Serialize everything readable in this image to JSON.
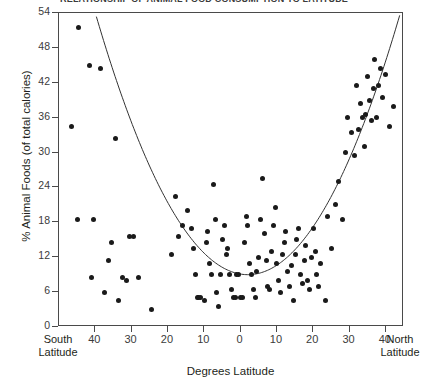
{
  "figure": {
    "title_clipped": "RELATIONSHIP OF ANIMAL FOOD CONSUMPTION TO LATITUDE",
    "width": 428,
    "height": 383
  },
  "axes": {
    "ylabel": "% Animal Foods (of total calories)",
    "xlabel": "Degrees Latitude",
    "left_edge_label_line1": "South",
    "left_edge_label_line2": "Latitude",
    "right_edge_label_line1": "North",
    "right_edge_label_line2": "Latitude",
    "yticks": [
      0,
      6,
      12,
      18,
      24,
      30,
      36,
      42,
      48,
      54
    ],
    "xticks": [
      40,
      30,
      20,
      10,
      0,
      10,
      20,
      30,
      40
    ]
  },
  "colors": {
    "marker": "#1a1a1a",
    "axis": "#4a4a4a",
    "curve": "#333333",
    "background": "#ffffff"
  },
  "chart_data": {
    "type": "scatter",
    "title": "RELATIONSHIP OF ANIMAL FOOD CONSUMPTION TO LATITUDE",
    "xlabel": "Degrees Latitude",
    "ylabel": "% Animal Foods (of total calories)",
    "xlim": [
      -50,
      45
    ],
    "ylim": [
      0,
      54
    ],
    "x_axis_note": "Negative values are South Latitude, positive values are North Latitude; tick labels show absolute degrees.",
    "grid": false,
    "legend": null,
    "ytick_values": [
      0,
      6,
      12,
      18,
      24,
      30,
      36,
      42,
      48,
      54
    ],
    "xtick_labels": [
      "South Latitude",
      "40",
      "30",
      "20",
      "10",
      "0",
      "10",
      "20",
      "30",
      "40",
      "North Latitude"
    ],
    "points": [
      [
        -44.5,
        51.5
      ],
      [
        -41.5,
        45.0
      ],
      [
        -38.5,
        44.5
      ],
      [
        -46.5,
        34.5
      ],
      [
        -34.5,
        32.5
      ],
      [
        -45.0,
        18.5
      ],
      [
        -40.5,
        18.5
      ],
      [
        -35.5,
        14.5
      ],
      [
        -41.0,
        8.5
      ],
      [
        -37.5,
        6.0
      ],
      [
        -36.5,
        11.5
      ],
      [
        -32.5,
        8.5
      ],
      [
        -31.5,
        8.0
      ],
      [
        -28.0,
        8.5
      ],
      [
        -33.5,
        4.5
      ],
      [
        -30.5,
        15.5
      ],
      [
        -29.5,
        15.5
      ],
      [
        -24.5,
        3.0
      ],
      [
        -19.0,
        12.5
      ],
      [
        -18.0,
        22.5
      ],
      [
        -17.0,
        15.5
      ],
      [
        -16.0,
        17.5
      ],
      [
        -14.5,
        20.0
      ],
      [
        -13.5,
        17.0
      ],
      [
        -13.0,
        13.5
      ],
      [
        -12.5,
        9.0
      ],
      [
        -12.0,
        5.0
      ],
      [
        -11.5,
        5.0
      ],
      [
        -11.0,
        5.0
      ],
      [
        -10.0,
        4.5
      ],
      [
        -9.5,
        14.5
      ],
      [
        -9.0,
        16.5
      ],
      [
        -8.5,
        11.0
      ],
      [
        -8.0,
        9.0
      ],
      [
        -7.5,
        24.5
      ],
      [
        -7.0,
        18.5
      ],
      [
        -6.5,
        6.0
      ],
      [
        -6.0,
        3.5
      ],
      [
        -5.5,
        9.0
      ],
      [
        -5.0,
        15.0
      ],
      [
        -4.5,
        17.5
      ],
      [
        -4.0,
        12.5
      ],
      [
        -3.5,
        13.5
      ],
      [
        -3.0,
        9.0
      ],
      [
        -2.5,
        6.5
      ],
      [
        -2.0,
        5.0
      ],
      [
        -1.5,
        5.0
      ],
      [
        -1.0,
        9.0
      ],
      [
        -0.5,
        9.0
      ],
      [
        0.0,
        5.0
      ],
      [
        0.5,
        5.0
      ],
      [
        1.0,
        14.5
      ],
      [
        1.5,
        19.0
      ],
      [
        2.0,
        17.5
      ],
      [
        2.5,
        11.0
      ],
      [
        3.0,
        9.0
      ],
      [
        3.5,
        6.5
      ],
      [
        4.0,
        5.0
      ],
      [
        4.5,
        9.5
      ],
      [
        5.0,
        12.0
      ],
      [
        5.5,
        18.5
      ],
      [
        6.0,
        25.5
      ],
      [
        6.5,
        16.0
      ],
      [
        7.0,
        11.5
      ],
      [
        7.5,
        7.0
      ],
      [
        8.0,
        6.5
      ],
      [
        8.5,
        13.0
      ],
      [
        9.0,
        17.5
      ],
      [
        9.5,
        20.5
      ],
      [
        10.0,
        11.0
      ],
      [
        10.5,
        8.0
      ],
      [
        11.0,
        6.0
      ],
      [
        11.5,
        12.5
      ],
      [
        12.0,
        14.5
      ],
      [
        12.5,
        16.5
      ],
      [
        13.0,
        9.5
      ],
      [
        13.5,
        7.0
      ],
      [
        14.0,
        10.5
      ],
      [
        14.5,
        4.5
      ],
      [
        15.0,
        12.5
      ],
      [
        15.5,
        15.0
      ],
      [
        16.0,
        17.0
      ],
      [
        16.5,
        9.0
      ],
      [
        17.0,
        7.5
      ],
      [
        17.5,
        11.5
      ],
      [
        18.0,
        14.0
      ],
      [
        18.5,
        8.0
      ],
      [
        19.0,
        6.5
      ],
      [
        19.5,
        12.0
      ],
      [
        20.0,
        17.0
      ],
      [
        20.5,
        13.0
      ],
      [
        21.0,
        9.0
      ],
      [
        21.5,
        7.0
      ],
      [
        22.0,
        11.0
      ],
      [
        23.5,
        4.5
      ],
      [
        24.0,
        19.0
      ],
      [
        25.0,
        13.5
      ],
      [
        26.0,
        21.0
      ],
      [
        27.0,
        25.0
      ],
      [
        28.0,
        18.5
      ],
      [
        29.0,
        30.0
      ],
      [
        29.5,
        36.0
      ],
      [
        30.5,
        33.5
      ],
      [
        31.5,
        29.5
      ],
      [
        32.0,
        41.5
      ],
      [
        32.5,
        34.0
      ],
      [
        33.0,
        38.5
      ],
      [
        33.5,
        36.0
      ],
      [
        34.0,
        31.0
      ],
      [
        34.5,
        36.5
      ],
      [
        35.0,
        43.0
      ],
      [
        35.5,
        39.0
      ],
      [
        36.0,
        35.5
      ],
      [
        36.5,
        41.0
      ],
      [
        37.0,
        46.0
      ],
      [
        37.5,
        36.0
      ],
      [
        38.0,
        41.5
      ],
      [
        38.5,
        44.5
      ],
      [
        39.0,
        39.5
      ],
      [
        40.0,
        43.5
      ],
      [
        41.0,
        34.5
      ],
      [
        42.0,
        38.0
      ]
    ],
    "fit_curve": {
      "kind": "quadratic",
      "description": "U-shaped parabola fitted to the data; minimum near 0-5 degrees latitude at about 9% animal foods, rising to 54% at both latitude extremes.",
      "vertex": [
        2.0,
        9.0
      ],
      "left_endpoint": [
        -50,
        54
      ],
      "right_endpoint": [
        44,
        54
      ]
    }
  }
}
